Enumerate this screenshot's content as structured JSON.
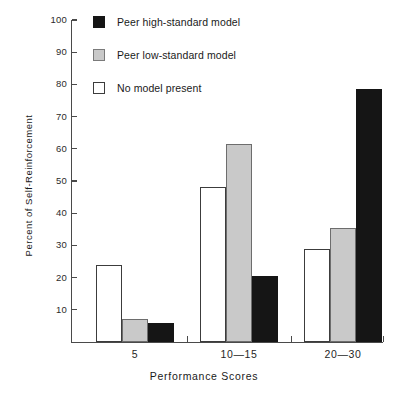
{
  "chart_data": {
    "type": "bar",
    "title": "",
    "xlabel": "Performance Scores",
    "ylabel": "Percent of Self-Reinforcement",
    "categories": [
      "5",
      "10—15",
      "20—30"
    ],
    "series": [
      {
        "name": "No model present",
        "color": "#ffffff",
        "values": [
          24.0,
          48.0,
          29.0
        ]
      },
      {
        "name": "Peer low-standard model",
        "color": "#c9c9c9",
        "values": [
          7.0,
          61.5,
          35.5
        ]
      },
      {
        "name": "Peer high-standard model",
        "color": "#151515",
        "values": [
          6.0,
          20.5,
          78.5
        ]
      }
    ],
    "ylim": [
      0,
      100
    ],
    "yticks": [
      10,
      20,
      30,
      40,
      50,
      60,
      70,
      80,
      90,
      100
    ],
    "ytick_labels": [
      "10",
      "20",
      "30",
      "40",
      "50",
      "60",
      "70",
      "80",
      "90",
      "100"
    ],
    "grid": false,
    "legend_position": "upper-left-inside",
    "legend_order": [
      "Peer high-standard model",
      "Peer low-standard model",
      "No model present"
    ]
  },
  "legend": {
    "items": [
      {
        "label": "Peer high-standard model",
        "swatch": "black"
      },
      {
        "label": "Peer low-standard model",
        "swatch": "gray"
      },
      {
        "label": "No model present",
        "swatch": "white"
      }
    ]
  },
  "axes": {
    "x_title": "Performance Scores",
    "y_title": "Percent of Self-Reinforcement"
  }
}
